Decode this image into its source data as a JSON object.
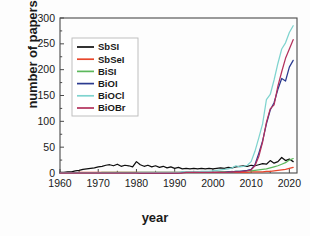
{
  "chart_data": {
    "type": "line",
    "title": "",
    "xlabel": "year",
    "ylabel": "number of papers",
    "xlim": [
      1960,
      2022
    ],
    "ylim": [
      0,
      300
    ],
    "xticks": [
      1960,
      1970,
      1980,
      1990,
      2000,
      2010,
      2020
    ],
    "yticks": [
      0,
      50,
      100,
      150,
      200,
      250,
      300
    ],
    "grid": false,
    "legend_position": "upper-left",
    "x": [
      1960,
      1961,
      1962,
      1963,
      1964,
      1965,
      1966,
      1967,
      1968,
      1969,
      1970,
      1971,
      1972,
      1973,
      1974,
      1975,
      1976,
      1977,
      1978,
      1979,
      1980,
      1981,
      1982,
      1983,
      1984,
      1985,
      1986,
      1987,
      1988,
      1989,
      1990,
      1991,
      1992,
      1993,
      1994,
      1995,
      1996,
      1997,
      1998,
      1999,
      2000,
      2001,
      2002,
      2003,
      2004,
      2005,
      2006,
      2007,
      2008,
      2009,
      2010,
      2011,
      2012,
      2013,
      2014,
      2015,
      2016,
      2017,
      2018,
      2019,
      2020,
      2021
    ],
    "series": [
      {
        "name": "SbSI",
        "color": "#0d0d0d",
        "values": [
          1,
          1,
          2,
          2,
          4,
          5,
          7,
          8,
          9,
          10,
          12,
          13,
          15,
          16,
          14,
          17,
          13,
          15,
          14,
          12,
          22,
          16,
          13,
          15,
          12,
          14,
          11,
          13,
          10,
          12,
          9,
          11,
          8,
          9,
          8,
          9,
          8,
          9,
          8,
          9,
          8,
          9,
          10,
          9,
          11,
          10,
          12,
          13,
          14,
          13,
          15,
          14,
          16,
          18,
          17,
          24,
          19,
          22,
          30,
          24,
          27,
          22
        ]
      },
      {
        "name": "SbSeI",
        "color": "#e8472c",
        "values": [
          0,
          0,
          0,
          0,
          0,
          1,
          1,
          1,
          1,
          1,
          1,
          1,
          1,
          1,
          1,
          1,
          1,
          1,
          1,
          1,
          1,
          1,
          1,
          1,
          1,
          1,
          1,
          1,
          1,
          1,
          1,
          1,
          1,
          1,
          1,
          1,
          1,
          1,
          1,
          1,
          1,
          1,
          1,
          1,
          1,
          1,
          1,
          1,
          1,
          1,
          2,
          2,
          2,
          2,
          3,
          3,
          4,
          5,
          6,
          7,
          9,
          11
        ]
      },
      {
        "name": "BiSI",
        "color": "#5cb85c",
        "values": [
          0,
          0,
          0,
          0,
          0,
          0,
          0,
          0,
          0,
          0,
          0,
          1,
          1,
          1,
          1,
          1,
          1,
          1,
          1,
          1,
          1,
          1,
          1,
          1,
          1,
          1,
          1,
          1,
          1,
          1,
          1,
          1,
          1,
          1,
          1,
          1,
          1,
          1,
          1,
          1,
          1,
          1,
          2,
          2,
          2,
          2,
          3,
          3,
          3,
          4,
          4,
          5,
          6,
          7,
          8,
          10,
          12,
          14,
          17,
          20,
          25,
          28
        ]
      },
      {
        "name": "BiOI",
        "color": "#2b3a8f",
        "values": [
          0,
          0,
          0,
          0,
          0,
          0,
          0,
          0,
          0,
          0,
          0,
          0,
          0,
          0,
          0,
          0,
          0,
          0,
          0,
          0,
          0,
          0,
          0,
          0,
          0,
          0,
          0,
          0,
          0,
          0,
          0,
          0,
          1,
          1,
          1,
          1,
          1,
          1,
          1,
          1,
          1,
          1,
          1,
          1,
          2,
          2,
          3,
          3,
          4,
          5,
          7,
          16,
          38,
          62,
          95,
          122,
          136,
          162,
          183,
          178,
          205,
          218
        ]
      },
      {
        "name": "BiOCl",
        "color": "#7fd4cf",
        "values": [
          0,
          0,
          0,
          0,
          0,
          0,
          0,
          0,
          0,
          0,
          0,
          0,
          0,
          0,
          0,
          0,
          0,
          0,
          0,
          0,
          0,
          1,
          1,
          1,
          1,
          1,
          1,
          1,
          1,
          1,
          1,
          1,
          2,
          2,
          2,
          2,
          2,
          3,
          3,
          3,
          4,
          5,
          6,
          7,
          8,
          10,
          14,
          12,
          13,
          15,
          22,
          42,
          68,
          95,
          142,
          152,
          180,
          212,
          240,
          252,
          272,
          285
        ]
      },
      {
        "name": "BiOBr",
        "color": "#b3315c",
        "values": [
          0,
          0,
          0,
          0,
          0,
          0,
          0,
          0,
          0,
          0,
          0,
          0,
          0,
          0,
          0,
          0,
          0,
          0,
          0,
          0,
          0,
          0,
          0,
          0,
          0,
          0,
          0,
          0,
          0,
          0,
          0,
          0,
          0,
          1,
          1,
          1,
          1,
          1,
          1,
          1,
          1,
          1,
          1,
          1,
          1,
          2,
          2,
          2,
          3,
          4,
          6,
          14,
          32,
          60,
          98,
          124,
          132,
          168,
          196,
          222,
          240,
          258
        ]
      }
    ]
  }
}
